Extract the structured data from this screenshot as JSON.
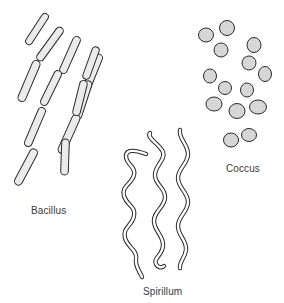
{
  "figure": {
    "background": "#ffffff",
    "stroke_color": "#2a2a2a",
    "fill_texture_color": "#e8e8e8"
  },
  "labels": {
    "bacillus": "Bacillus",
    "coccus": "Coccus",
    "spirillum": "Spirillum"
  },
  "groups": [
    {
      "name": "Bacillus",
      "shape": "rod",
      "count": 12
    },
    {
      "name": "Coccus",
      "shape": "sphere",
      "count": 15
    },
    {
      "name": "Spirillum",
      "shape": "spiral",
      "count": 3
    }
  ]
}
